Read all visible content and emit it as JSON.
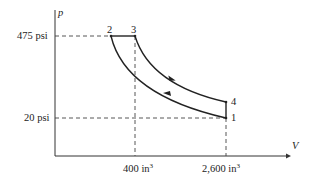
{
  "diagram": {
    "type": "p-V cycle diagram",
    "axes": {
      "y_label": "p",
      "x_label": "V"
    },
    "ticks": {
      "p_high": "475 psi",
      "p_low": "20 psi",
      "v_low": "400 in",
      "v_low_exp": "3",
      "v_high": "2,600 in",
      "v_high_exp": "3"
    },
    "points": [
      {
        "id": "1",
        "label": "1",
        "p": "20 psi",
        "V": "2,600 in³"
      },
      {
        "id": "2",
        "label": "2",
        "p": "475 psi",
        "V": ""
      },
      {
        "id": "3",
        "label": "3",
        "p": "475 psi",
        "V": "400 in³"
      },
      {
        "id": "4",
        "label": "4",
        "p": "",
        "V": "2,600 in³"
      }
    ],
    "processes": [
      {
        "from": "1",
        "to": "2",
        "shape": "curve",
        "arrow": "toward 2"
      },
      {
        "from": "2",
        "to": "3",
        "shape": "horizontal line"
      },
      {
        "from": "3",
        "to": "4",
        "shape": "curve",
        "arrow": "toward 4"
      },
      {
        "from": "4",
        "to": "1",
        "shape": "vertical line"
      }
    ],
    "colors": {
      "line": "#222222",
      "dashed": "#444444",
      "background": "#ffffff"
    }
  }
}
